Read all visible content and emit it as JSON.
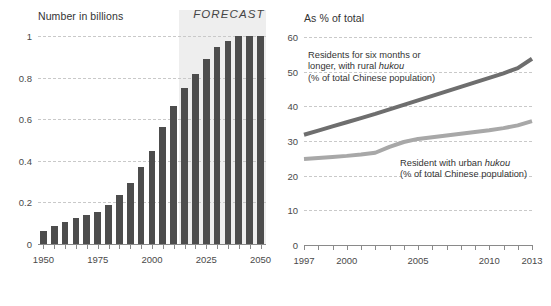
{
  "chart_data": [
    {
      "type": "bar",
      "title": "Number in billions",
      "xlabel": "",
      "ylabel": "Number in billions",
      "ylim": [
        0,
        1.05
      ],
      "yticks": [
        0,
        0.2,
        0.4,
        0.6,
        0.8,
        1
      ],
      "ytick_labels": [
        "0",
        "0.2",
        "0.4",
        "0.6",
        "0.8",
        "1"
      ],
      "xticks": [
        1950,
        1975,
        2000,
        2025,
        2050
      ],
      "xtick_labels": [
        "1950",
        "1975",
        "2000",
        "2025",
        "2050"
      ],
      "xlim": [
        1947.5,
        2052.5
      ],
      "grid": true,
      "legend": "none",
      "annotation": "FORECAST",
      "forecast_start_year": 2015,
      "categories": [
        1950,
        1955,
        1960,
        1965,
        1970,
        1975,
        1980,
        1985,
        1990,
        1995,
        2000,
        2005,
        2010,
        2015,
        2020,
        2025,
        2030,
        2035,
        2040,
        2045,
        2050
      ],
      "values": [
        0.063,
        0.088,
        0.104,
        0.127,
        0.139,
        0.152,
        0.19,
        0.237,
        0.294,
        0.373,
        0.449,
        0.562,
        0.665,
        0.75,
        0.82,
        0.89,
        0.95,
        0.98,
        1.0,
        1.0,
        1.0
      ]
    },
    {
      "type": "line",
      "title": "As % of total",
      "xlabel": "",
      "ylabel": "As % of total",
      "ylim": [
        0,
        62
      ],
      "yticks": [
        0,
        10,
        20,
        30,
        40,
        50,
        60
      ],
      "ytick_labels": [
        "0",
        "10",
        "20",
        "30",
        "40",
        "50",
        "60"
      ],
      "xticks": [
        1997,
        2000,
        2005,
        2010,
        2013
      ],
      "xtick_labels": [
        "1997",
        "2000",
        "2005",
        "2010",
        "2013"
      ],
      "xlim": [
        1997,
        2013
      ],
      "grid": true,
      "legend": "inline-annotations",
      "x": [
        1997,
        1998,
        1999,
        2000,
        2001,
        2002,
        2003,
        2004,
        2005,
        2006,
        2007,
        2008,
        2009,
        2010,
        2011,
        2012,
        2013
      ],
      "series": [
        {
          "name": "Residents for six months or longer, with rural hukou (% of total Chinese population)",
          "color": "#6e6e6e",
          "values": [
            31.8,
            33.0,
            34.2,
            35.4,
            36.6,
            37.8,
            39.1,
            40.4,
            41.7,
            43.0,
            44.3,
            45.6,
            46.9,
            48.2,
            49.5,
            51.0,
            53.7
          ]
        },
        {
          "name": "Resident with urban hukou (% of total Chinese population)",
          "color": "#a8a8a8",
          "values": [
            24.8,
            25.1,
            25.4,
            25.7,
            26.1,
            26.6,
            28.3,
            29.7,
            30.6,
            31.1,
            31.6,
            32.1,
            32.6,
            33.1,
            33.7,
            34.5,
            35.7
          ]
        }
      ]
    }
  ],
  "left_chart": {
    "title": "Number in billions",
    "forecast_label": "FORECAST",
    "y_labels": [
      "1",
      "0.8",
      "0.6",
      "0.4",
      "0.2",
      "0"
    ],
    "x_labels": [
      "1950",
      "1975",
      "2000",
      "2025",
      "2050"
    ]
  },
  "right_chart": {
    "title": "As % of total",
    "y_labels": [
      "60",
      "50",
      "40",
      "30",
      "20",
      "10",
      "0"
    ],
    "x_labels": [
      "1997",
      "2000",
      "2005",
      "2010",
      "2013"
    ],
    "annotation_rural_line1": "Residents for six months or",
    "annotation_rural_line2_a": "longer, with rural ",
    "annotation_rural_line2_b": "hukou",
    "annotation_rural_line3": "(% of total Chinese population)",
    "annotation_urban_line1_a": "Resident with urban ",
    "annotation_urban_line1_b": "hukou",
    "annotation_urban_line2": "(% of total Chinese population)"
  },
  "colors": {
    "bar": "#4d4d4d",
    "forecast_shade": "#eeeeee",
    "line_rural": "#6e6e6e",
    "line_urban": "#a8a8a8",
    "grid": "#c9c9c9",
    "axis": "#8a8a8a"
  }
}
